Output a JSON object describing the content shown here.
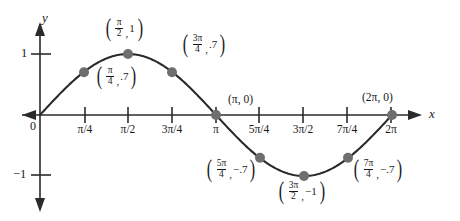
{
  "figure": {
    "axis_x_name": "x",
    "axis_y_name": "y",
    "origin_label": "0",
    "y_tick_pos": "1",
    "y_tick_neg": "−1",
    "curve_color": "#2b2b2b",
    "point_color": "#6e6e6e",
    "axis_color": "#2b2b2b"
  },
  "x_ticks": [
    {
      "label": "π/4",
      "x": 85
    },
    {
      "label": "π/2",
      "x": 128
    },
    {
      "label": "3π/4",
      "x": 172
    },
    {
      "label": "π",
      "x": 216
    },
    {
      "label": "5π/4",
      "x": 259
    },
    {
      "label": "3π/2",
      "x": 303
    },
    {
      "label": "7π/4",
      "x": 347
    },
    {
      "label": "2π",
      "x": 391
    }
  ],
  "point_labels": [
    {
      "id": "p-pi2",
      "num": "π",
      "den": "2",
      "comma": ",",
      "value": "1",
      "style": "frac"
    },
    {
      "id": "p-3pi4",
      "num": "3π",
      "den": "4",
      "comma": ",",
      "value": ".7",
      "style": "frac"
    },
    {
      "id": "p-pi4",
      "num": "π",
      "den": "4",
      "comma": ",",
      "value": ".7",
      "style": "frac"
    },
    {
      "id": "p-5pi4",
      "num": "5π",
      "den": "4",
      "comma": ",",
      "value": "−.7",
      "style": "frac"
    },
    {
      "id": "p-3pi2",
      "num": "3π",
      "den": "2",
      "comma": ",",
      "value": "−1",
      "style": "frac"
    },
    {
      "id": "p-7pi4",
      "num": "7π",
      "den": "4",
      "comma": ",",
      "value": "−.7",
      "style": "frac"
    },
    {
      "id": "p-pi0",
      "text": "(π, 0)",
      "style": "plain"
    },
    {
      "id": "p-2pi0",
      "text": "(2π, 0)",
      "style": "plain"
    }
  ],
  "chart_data": {
    "type": "line",
    "title": "",
    "xlabel": "x",
    "ylabel": "y",
    "function": "y = sin x",
    "xlim": [
      0,
      6.283185
    ],
    "ylim": [
      -1,
      1
    ],
    "grid": false,
    "legend": "none",
    "x_tick_labels": [
      "π/4",
      "π/2",
      "3π/4",
      "π",
      "5π/4",
      "3π/2",
      "7π/4",
      "2π"
    ],
    "x_tick_values": [
      0.7854,
      1.5708,
      2.3562,
      3.1416,
      3.927,
      4.7124,
      5.4978,
      6.2832
    ],
    "y_tick_labels": [
      "1",
      "−1"
    ],
    "y_tick_values": [
      1,
      -1
    ],
    "marked_points": [
      {
        "x_label": "0",
        "x": 0,
        "y": 0
      },
      {
        "x_label": "π/4",
        "x": 0.7854,
        "y": 0.7
      },
      {
        "x_label": "π/2",
        "x": 1.5708,
        "y": 1
      },
      {
        "x_label": "3π/4",
        "x": 2.3562,
        "y": 0.7
      },
      {
        "x_label": "π",
        "x": 3.1416,
        "y": 0
      },
      {
        "x_label": "5π/4",
        "x": 3.927,
        "y": -0.7
      },
      {
        "x_label": "3π/2",
        "x": 4.7124,
        "y": -1
      },
      {
        "x_label": "7π/4",
        "x": 5.4978,
        "y": -0.7
      },
      {
        "x_label": "2π",
        "x": 6.2832,
        "y": 0
      }
    ],
    "annotations": [
      "(π/2, 1)",
      "(3π/4, .7)",
      "(π/4, .7)",
      "(π, 0)",
      "(2π, 0)",
      "(5π/4, −.7)",
      "(3π/2, −1)",
      "(7π/4, −.7)"
    ]
  }
}
